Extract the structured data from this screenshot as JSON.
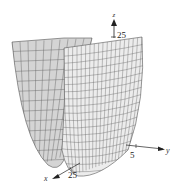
{
  "chart_data": {
    "type": "surface",
    "title": "",
    "axes": {
      "x": {
        "label": "x",
        "tick_labels": [
          "25"
        ]
      },
      "y": {
        "label": "y",
        "tick_labels": [
          "5"
        ]
      },
      "z": {
        "label": "z",
        "tick_labels": [
          "25"
        ]
      }
    },
    "colors": {
      "surface_back": "#d4d4d4",
      "surface_front": "#ececec",
      "mesh": "#555555",
      "axis": "#222222"
    },
    "grid": true
  }
}
